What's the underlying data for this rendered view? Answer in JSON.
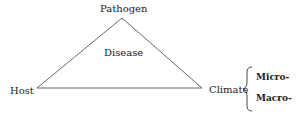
{
  "diagram": {
    "type": "disease-triangle",
    "vertices": {
      "top": "Pathogen",
      "left": "Host",
      "right": "Climate"
    },
    "center_label": "Disease",
    "climate_subtypes": [
      "Micro-",
      "Macro-"
    ]
  }
}
